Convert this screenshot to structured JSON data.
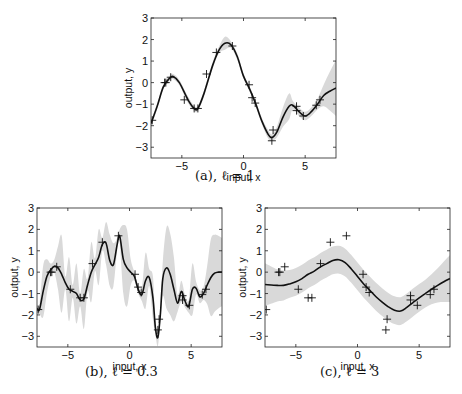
{
  "chart_data": [
    {
      "id": "a",
      "type": "line",
      "caption": "(a), ℓ = 1",
      "caption_prefix": "(a), ",
      "caption_param": "ℓ = 1",
      "title": "",
      "xlabel": "input, x",
      "ylabel": "output, y",
      "xlim": [
        -7.5,
        7.5
      ],
      "ylim": [
        -3.5,
        3
      ],
      "xticks": [
        -5,
        0,
        5
      ],
      "yticks": [
        -3,
        -2,
        -1,
        0,
        1,
        2,
        3
      ],
      "grid": false,
      "legend": null,
      "series": [
        {
          "name": "predictive mean",
          "kind": "line",
          "color": "#111111",
          "x": [
            -7.5,
            -7,
            -6.5,
            -6,
            -5.7,
            -5.2,
            -4.5,
            -4,
            -3.7,
            -3.2,
            -2.5,
            -2,
            -1.5,
            -1,
            -0.5,
            0,
            0.5,
            1,
            1.5,
            2,
            2.3,
            2.7,
            3.2,
            3.7,
            4,
            4.5,
            5,
            5.5,
            6,
            6.5,
            7,
            7.5
          ],
          "y": [
            -1.9,
            -1.1,
            -0.2,
            0.2,
            0.28,
            0.0,
            -0.8,
            -1.2,
            -1.2,
            -0.5,
            0.8,
            1.5,
            1.83,
            1.75,
            1.2,
            0.3,
            -0.3,
            -1.0,
            -1.8,
            -2.4,
            -2.55,
            -2.3,
            -1.6,
            -1.1,
            -1.05,
            -1.35,
            -1.55,
            -1.35,
            -1.0,
            -0.6,
            -0.4,
            -0.25
          ]
        },
        {
          "name": "95% confidence band (half-width)",
          "kind": "band",
          "color": "#d9d9d9",
          "halfwidth": [
            0.15,
            0.12,
            0.12,
            0.12,
            0.12,
            0.12,
            0.15,
            0.12,
            0.12,
            0.15,
            0.15,
            0.15,
            0.3,
            0.15,
            0.15,
            0.12,
            0.12,
            0.12,
            0.15,
            0.2,
            0.15,
            0.25,
            0.45,
            0.6,
            0.2,
            0.2,
            0.2,
            0.2,
            0.25,
            0.5,
            0.9,
            1.3
          ]
        },
        {
          "name": "training data",
          "kind": "scatter",
          "marker": "+",
          "x": [
            -7.4,
            -6.4,
            -6.3,
            -5.9,
            -4.8,
            -4.0,
            -3.7,
            -3.0,
            -2.2,
            -0.9,
            0.45,
            0.7,
            0.95,
            2.4,
            2.3,
            4.3,
            4.3,
            4.85,
            5.9,
            6.2
          ],
          "y": [
            -1.75,
            0.0,
            0.0,
            0.25,
            -0.8,
            -1.2,
            -1.2,
            0.4,
            1.4,
            1.7,
            -0.1,
            -0.7,
            -0.95,
            -2.2,
            -2.7,
            -1.1,
            -1.3,
            -1.55,
            -1.05,
            -0.8
          ]
        }
      ]
    },
    {
      "id": "b",
      "type": "line",
      "caption": "(b), ℓ = 0.3",
      "caption_prefix": "(b), ",
      "caption_param": "ℓ = 0.3",
      "title": "",
      "xlabel": "input, x",
      "ylabel": "output, y",
      "xlim": [
        -7.5,
        7.5
      ],
      "ylim": [
        -3.5,
        3
      ],
      "xticks": [
        -5,
        0,
        5
      ],
      "yticks": [
        -3,
        -2,
        -1,
        0,
        1,
        2,
        3
      ],
      "grid": false,
      "legend": null,
      "series": [
        {
          "name": "predictive mean",
          "kind": "line",
          "color": "#111111",
          "x": [
            -7.5,
            -7.3,
            -7.0,
            -6.7,
            -6.4,
            -6.1,
            -5.8,
            -5.5,
            -5.2,
            -4.9,
            -4.6,
            -4.3,
            -4.0,
            -3.7,
            -3.4,
            -3.1,
            -2.8,
            -2.5,
            -2.2,
            -1.9,
            -1.6,
            -1.3,
            -1.0,
            -0.8,
            -0.5,
            -0.2,
            0.1,
            0.4,
            0.7,
            1.0,
            1.3,
            1.6,
            1.9,
            2.1,
            2.3,
            2.5,
            2.7,
            3.0,
            3.3,
            3.6,
            3.9,
            4.2,
            4.5,
            4.8,
            5.1,
            5.4,
            5.7,
            6.0,
            6.3,
            6.6,
            6.9,
            7.2,
            7.5
          ],
          "y": [
            -1.7,
            -1.75,
            -0.9,
            -0.2,
            0.1,
            0.28,
            0.2,
            -0.1,
            -0.5,
            -0.8,
            -0.9,
            -1.0,
            -1.3,
            -1.25,
            -0.6,
            0.0,
            0.35,
            0.7,
            1.3,
            1.35,
            0.55,
            0.35,
            1.3,
            1.7,
            0.6,
            0.2,
            0.0,
            -0.2,
            -0.8,
            -1.05,
            -0.4,
            -0.25,
            -1.2,
            -2.6,
            -3.05,
            -2.0,
            -0.3,
            0.2,
            -0.1,
            -0.8,
            -1.45,
            -0.9,
            -1.35,
            -1.6,
            -0.8,
            -0.75,
            -1.15,
            -1.0,
            -0.6,
            -0.25,
            -0.05,
            0.0,
            0.0
          ]
        },
        {
          "name": "95% confidence band (half-width)",
          "kind": "band",
          "color": "#d9d9d9",
          "halfwidth": [
            0.2,
            0.2,
            1.2,
            0.8,
            0.3,
            0.3,
            1.0,
            1.8,
            0.3,
            1.5,
            0.3,
            1.4,
            0.3,
            1.4,
            0.3,
            1.4,
            0.3,
            1.3,
            0.3,
            1.0,
            1.2,
            1.0,
            0.3,
            0.3,
            1.6,
            1.8,
            0.6,
            0.2,
            0.2,
            0.3,
            1.3,
            0.4,
            1.0,
            0.3,
            0.4,
            0.3,
            0.8,
            1.9,
            1.9,
            1.5,
            0.4,
            0.5,
            0.3,
            0.3,
            1.2,
            0.3,
            0.3,
            0.3,
            0.9,
            1.8,
            1.8,
            1.7,
            1.6
          ]
        },
        {
          "name": "training data",
          "kind": "scatter",
          "marker": "+",
          "x": [
            -7.4,
            -6.4,
            -6.3,
            -5.9,
            -4.8,
            -4.0,
            -3.7,
            -3.0,
            -2.2,
            -0.9,
            0.45,
            0.7,
            0.95,
            2.4,
            2.3,
            4.3,
            4.3,
            4.85,
            5.9,
            6.2
          ],
          "y": [
            -1.75,
            0.0,
            0.0,
            0.25,
            -0.8,
            -1.2,
            -1.2,
            0.4,
            1.4,
            1.7,
            -0.1,
            -0.7,
            -0.95,
            -2.2,
            -2.7,
            -1.1,
            -1.3,
            -1.55,
            -1.05,
            -0.8
          ]
        }
      ]
    },
    {
      "id": "c",
      "type": "line",
      "caption": "(c), ℓ = 3",
      "caption_prefix": "(c), ",
      "caption_param": "ℓ = 3",
      "title": "",
      "xlabel": "input, x",
      "ylabel": "output, y",
      "xlim": [
        -7.5,
        7.5
      ],
      "ylim": [
        -3.5,
        3
      ],
      "xticks": [
        -5,
        0,
        5
      ],
      "yticks": [
        -3,
        -2,
        -1,
        0,
        1,
        2,
        3
      ],
      "grid": false,
      "legend": null,
      "series": [
        {
          "name": "predictive mean",
          "kind": "line",
          "color": "#111111",
          "x": [
            -7.5,
            -6.5,
            -6,
            -5.5,
            -5,
            -4.5,
            -4,
            -3.5,
            -3,
            -2.5,
            -2,
            -1.5,
            -1,
            -0.5,
            0,
            0.5,
            1,
            1.5,
            2,
            2.5,
            3,
            3.5,
            4,
            4.5,
            5,
            5.5,
            6,
            6.5,
            7,
            7.5
          ],
          "y": [
            -0.58,
            -0.62,
            -0.62,
            -0.55,
            -0.45,
            -0.3,
            -0.1,
            0.05,
            0.25,
            0.4,
            0.55,
            0.58,
            0.45,
            0.15,
            -0.2,
            -0.55,
            -0.85,
            -1.15,
            -1.4,
            -1.62,
            -1.78,
            -1.82,
            -1.65,
            -1.42,
            -1.2,
            -1.0,
            -0.8,
            -0.62,
            -0.45,
            -0.3
          ]
        },
        {
          "name": "95% confidence band (half-width)",
          "kind": "band",
          "color": "#d9d9d9",
          "halfwidth": [
            1.0,
            0.75,
            0.7,
            0.65,
            0.65,
            0.65,
            0.65,
            0.65,
            0.65,
            0.65,
            0.65,
            0.65,
            0.65,
            0.65,
            0.65,
            0.65,
            0.65,
            0.65,
            0.65,
            0.65,
            0.65,
            0.65,
            0.65,
            0.65,
            0.65,
            0.65,
            0.7,
            0.8,
            0.95,
            1.1
          ]
        },
        {
          "name": "training data",
          "kind": "scatter",
          "marker": "+",
          "x": [
            -7.4,
            -6.4,
            -6.3,
            -5.9,
            -4.8,
            -4.0,
            -3.7,
            -3.0,
            -2.2,
            -0.9,
            0.45,
            0.7,
            0.95,
            2.4,
            2.3,
            4.3,
            4.3,
            4.85,
            5.9,
            6.2
          ],
          "y": [
            -1.75,
            0.0,
            0.0,
            0.25,
            -0.8,
            -1.2,
            -1.2,
            0.4,
            1.4,
            1.7,
            -0.1,
            -0.7,
            -0.95,
            -2.2,
            -2.7,
            -1.1,
            -1.3,
            -1.55,
            -1.05,
            -0.8
          ]
        }
      ]
    }
  ],
  "layout": {
    "panels": [
      {
        "id": "a",
        "box": [
          151,
          18,
          336,
          158
        ],
        "caption_pos": [
          195,
          180
        ]
      },
      {
        "id": "b",
        "box": [
          37,
          208,
          222,
          347
        ],
        "caption_pos": [
          85,
          376
        ]
      },
      {
        "id": "c",
        "box": [
          265,
          208,
          450,
          347
        ],
        "caption_pos": [
          320,
          376
        ]
      }
    ]
  }
}
